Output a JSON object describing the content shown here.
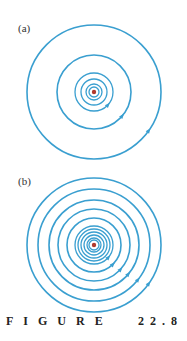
{
  "figure": {
    "caption_word": "FIGURE",
    "caption_number": "22.8",
    "line_color": "#3a9fd0",
    "center_color": "#b03a2e"
  },
  "panels": [
    {
      "label": "(a)",
      "center": [
        94,
        92
      ],
      "radii": [
        67,
        37,
        19,
        13,
        8,
        5
      ],
      "arrow_angles_deg": [
        35,
        40,
        42
      ]
    },
    {
      "label": "(b)",
      "center": [
        94,
        245
      ],
      "radii": [
        67,
        56,
        45,
        36,
        27,
        19,
        16,
        13,
        10,
        7,
        5
      ],
      "arrow_angles_deg": [
        35,
        38,
        40,
        42,
        45
      ]
    }
  ]
}
